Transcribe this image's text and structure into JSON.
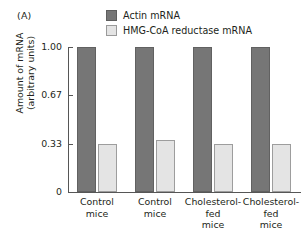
{
  "panel": {
    "label": "(A)"
  },
  "legend": {
    "entries": [
      {
        "label": "Actin mRNA",
        "swatch": "dark",
        "color": "#767676"
      },
      {
        "label": "HMG-CoA reductase mRNA",
        "swatch": "light",
        "color": "#e4e4e4"
      }
    ]
  },
  "axes": {
    "y_title_line1": "Amount of mRNA",
    "y_title_line2": "(arbitrary units)",
    "y_ticks": [
      "1.00",
      "0.67",
      "0.33",
      "0"
    ],
    "y_tick_values": [
      1.0,
      0.67,
      0.33,
      0
    ]
  },
  "chart_data": {
    "type": "bar",
    "title": "",
    "subtitle": "",
    "xlabel": "",
    "ylabel": "Amount of mRNA (arbitrary units)",
    "ylim": [
      0,
      1.0
    ],
    "yticks": [
      0,
      0.33,
      0.67,
      1.0
    ],
    "ytick_labels": [
      "0",
      "0.33",
      "0.67",
      "1.00"
    ],
    "grid": false,
    "legend_position": "top-center",
    "categories": [
      "Control mice",
      "Control mice",
      "Cholesterol-fed mice",
      "Cholesterol-fed mice"
    ],
    "category_lines": [
      [
        "Control",
        "mice"
      ],
      [
        "Control",
        "mice"
      ],
      [
        "Cholesterol-fed",
        "mice"
      ],
      [
        "Cholesterol-fed",
        "mice"
      ]
    ],
    "series": [
      {
        "name": "Actin mRNA",
        "color": "#767676",
        "values": [
          1.0,
          1.0,
          1.0,
          1.0
        ]
      },
      {
        "name": "HMG-CoA reductase mRNA",
        "color": "#e4e4e4",
        "values": [
          0.33,
          0.36,
          0.33,
          0.33
        ]
      }
    ]
  }
}
